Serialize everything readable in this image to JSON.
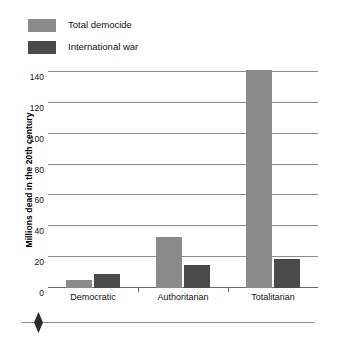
{
  "chart_data": {
    "type": "bar",
    "title": "",
    "xlabel": "",
    "ylabel": "Millions dead in the 20th century",
    "categories": [
      "Democratic",
      "Authoritarian",
      "Totalitarian"
    ],
    "series": [
      {
        "name": "Total democide",
        "color": "#8a8a8a",
        "values": [
          5,
          33,
          141
        ]
      },
      {
        "name": "International war",
        "color": "#4a4a4a",
        "values": [
          9,
          15,
          19
        ]
      }
    ],
    "ylim": [
      0,
      140
    ],
    "yticks": [
      0,
      20,
      40,
      60,
      80,
      100,
      120,
      140
    ],
    "ytick_labels": [
      "0",
      "20",
      "40",
      "60",
      "80",
      "100",
      "120",
      "140"
    ],
    "grid": true,
    "legend_position": "top-left"
  },
  "footer": {
    "ornament": "diamond"
  }
}
